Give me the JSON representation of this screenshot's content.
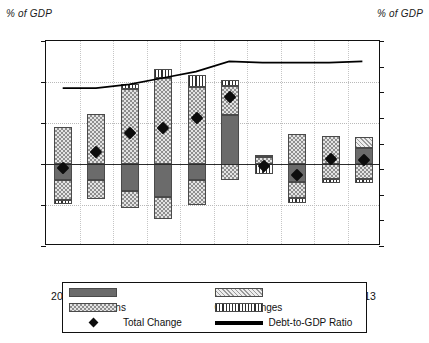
{
  "axis_titles": {
    "left": "% of GDP",
    "right": "% of GDP"
  },
  "legend": {
    "gdp": "GDP",
    "inflation": "Inflation",
    "transactions": "Transactions",
    "other_changes": "Other Changes",
    "total_change": "Total Change",
    "debt_ratio": "Debt-to-GDP Ratio"
  },
  "colors": {
    "gdp": "#6b6b6b",
    "transactions": "#e4e4e4",
    "inflation": "#ededed",
    "other_changes": "#f2f2f2",
    "marker": "#0d0d0d",
    "debt_line": "#000000",
    "frame": "#111111",
    "grid": "#b9b9b9"
  },
  "chart_data": {
    "type": "bar",
    "title": "",
    "subtitle": "",
    "xlabel": "",
    "ylabel": "% of GDP",
    "y2label": "% of GDP",
    "ylim": [
      -10,
      15
    ],
    "y2lim": [
      0,
      160
    ],
    "yticks": [
      -10,
      -5,
      0,
      5,
      10,
      15
    ],
    "y2ticks": [
      0,
      20,
      40,
      60,
      80,
      100,
      120,
      140,
      160
    ],
    "grid": true,
    "legend_position": "bottom",
    "categories": [
      "2004",
      "2005",
      "2006",
      "2007",
      "2008",
      "2009",
      "2010",
      "2011",
      "2012",
      "2013"
    ],
    "stacked_segments": [
      {
        "name": "GDP",
        "key": "gdp",
        "values": [
          -2.0,
          -2.0,
          -3.3,
          -4.0,
          -2.0,
          -7.9,
          0.0,
          -2.2,
          0.0,
          2.0
        ]
      },
      {
        "name": "Transactions",
        "key": "transactions",
        "values": [
          4.5,
          6.1,
          9.4,
          10.5,
          9.4,
          6.0,
          0.6,
          3.6,
          3.4,
          1.4
        ]
      },
      {
        "name": "Inflation",
        "key": "inflation",
        "values": [
          0.0,
          0.0,
          0.0,
          0.0,
          0.0,
          0.0,
          0.0,
          0.0,
          0.0,
          1.3
        ]
      },
      {
        "name": "Other Changes",
        "key": "other_changes",
        "values": [
          0.4,
          0.0,
          0.3,
          1.1,
          1.5,
          0.8,
          1.5,
          0.7,
          0.5,
          0.5
        ]
      }
    ],
    "bars": [
      {
        "year": "2004",
        "segments": [
          {
            "series": "Transactions",
            "from": 0.0,
            "to": 4.5
          },
          {
            "series": "GDP",
            "from": 0.0,
            "to": -2.0
          },
          {
            "series": "Transactions",
            "from": -2.0,
            "to": -4.4
          },
          {
            "series": "Other Changes",
            "from": -4.4,
            "to": -4.9
          }
        ]
      },
      {
        "year": "2005",
        "segments": [
          {
            "series": "Transactions",
            "from": 0.0,
            "to": 6.1
          },
          {
            "series": "GDP",
            "from": 0.0,
            "to": -2.0
          },
          {
            "series": "Transactions",
            "from": -2.0,
            "to": -4.3
          }
        ]
      },
      {
        "year": "2006",
        "segments": [
          {
            "series": "Other Changes",
            "from": 9.1,
            "to": 9.7
          },
          {
            "series": "Transactions",
            "from": 0.0,
            "to": 9.1
          },
          {
            "series": "GDP",
            "from": 0.0,
            "to": -3.3
          },
          {
            "series": "Transactions",
            "from": -3.3,
            "to": -5.4
          }
        ]
      },
      {
        "year": "2007",
        "segments": [
          {
            "series": "Other Changes",
            "from": 10.5,
            "to": 11.6
          },
          {
            "series": "Transactions",
            "from": 0.0,
            "to": 10.5
          },
          {
            "series": "GDP",
            "from": 0.0,
            "to": -4.0
          },
          {
            "series": "Transactions",
            "from": -4.0,
            "to": -6.7
          }
        ]
      },
      {
        "year": "2008",
        "segments": [
          {
            "series": "Other Changes",
            "from": 9.4,
            "to": 10.9
          },
          {
            "series": "Transactions",
            "from": 0.0,
            "to": 9.4
          },
          {
            "series": "GDP",
            "from": 0.0,
            "to": -2.0
          },
          {
            "series": "Transactions",
            "from": -2.0,
            "to": -5.0
          }
        ]
      },
      {
        "year": "2009",
        "segments": [
          {
            "series": "Other Changes",
            "from": 9.5,
            "to": 10.3
          },
          {
            "series": "Transactions",
            "from": 6.0,
            "to": 9.5
          },
          {
            "series": "GDP",
            "from": -1.9,
            "to": 6.0
          },
          {
            "series": "Transactions",
            "from": -1.9,
            "to": 0.0
          }
        ]
      },
      {
        "year": "2010",
        "segments": [
          {
            "series": "Other Changes",
            "from": 0.85,
            "to": 1.05
          },
          {
            "series": "Transactions",
            "from": 0.0,
            "to": 0.85
          },
          {
            "series": "Other Changes",
            "from": -1.2,
            "to": 0.0
          }
        ]
      },
      {
        "year": "2011",
        "segments": [
          {
            "series": "Transactions",
            "from": 0.0,
            "to": 3.6
          },
          {
            "series": "GDP",
            "from": -2.2,
            "to": 0.0
          },
          {
            "series": "Transactions",
            "from": -4.1,
            "to": -2.2
          },
          {
            "series": "Other Changes",
            "from": -4.8,
            "to": -4.1
          }
        ]
      },
      {
        "year": "2012",
        "segments": [
          {
            "series": "Transactions",
            "from": 0.0,
            "to": 3.4
          },
          {
            "series": "Transactions",
            "from": -1.8,
            "to": 0.0
          },
          {
            "series": "Other Changes",
            "from": -2.3,
            "to": -1.8
          }
        ]
      },
      {
        "year": "2013",
        "segments": [
          {
            "series": "Inflation",
            "from": 2.0,
            "to": 3.3
          },
          {
            "series": "GDP",
            "from": 0.0,
            "to": 2.0
          },
          {
            "series": "Transactions",
            "from": -1.8,
            "to": 0.0
          },
          {
            "series": "Other Changes",
            "from": -2.3,
            "to": -1.8
          }
        ]
      }
    ],
    "total_change": {
      "name": "Total Change",
      "marker": "diamond",
      "values": [
        -0.5,
        1.5,
        3.8,
        4.4,
        5.6,
        8.2,
        -0.3,
        -1.4,
        0.6,
        0.5
      ]
    },
    "debt_to_gdp_ratio": {
      "name": "Debt-to-GDP Ratio",
      "axis": "right",
      "values": [
        123,
        123,
        126,
        131,
        136,
        144,
        143,
        143,
        143,
        144
      ]
    }
  }
}
